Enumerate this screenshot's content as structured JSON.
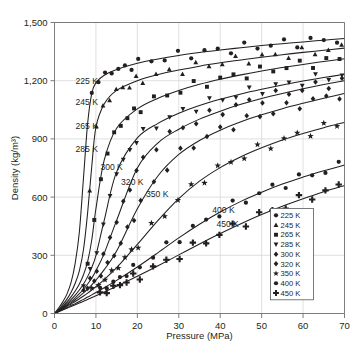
{
  "chart_data": {
    "type": "line",
    "title": "",
    "xlabel": "Pressure (MPa)",
    "ylabel": "Density (kg/m³)",
    "xlim": [
      0,
      70
    ],
    "ylim": [
      0,
      1500
    ],
    "xticks": [
      0,
      10,
      20,
      30,
      40,
      50,
      60,
      70
    ],
    "xtick_labels": [
      "0",
      "10",
      "20",
      "30",
      "40",
      "50",
      "60",
      "70"
    ],
    "yticks": [
      0,
      300,
      600,
      900,
      1200,
      1500
    ],
    "ytick_labels": [
      "0",
      "300",
      "600",
      "900",
      "1,200",
      "1,500"
    ],
    "grid": true,
    "legend_position": "inside-lower-right",
    "marker_color": "#231f20",
    "line_color": "#231f20",
    "grid_color": "#d8d8d8",
    "axis_color": "#6d6e71",
    "series": [
      {
        "name": "225 K",
        "label": "225 K",
        "marker": "circle",
        "inline_label": {
          "text": "225 K",
          "x": 10.5,
          "y": 1185
        },
        "line": {
          "x": [
            0,
            1,
            2,
            3,
            4,
            5,
            6,
            7,
            8,
            9,
            10,
            12,
            15,
            20,
            25,
            30,
            35,
            40,
            45,
            50,
            55,
            60,
            65,
            70
          ],
          "y": [
            0,
            28,
            60,
            100,
            160,
            260,
            420,
            700,
            980,
            1135,
            1190,
            1228,
            1258,
            1290,
            1312,
            1330,
            1345,
            1358,
            1370,
            1381,
            1391,
            1400,
            1409,
            1417
          ]
        },
        "points": {
          "x": [],
          "y": []
        }
      },
      {
        "name": "245 K",
        "label": "245 K",
        "marker": "triangle-up",
        "inline_label": {
          "text": "245 K",
          "x": 10.5,
          "y": 1075
        },
        "line": {
          "x": [
            0,
            1,
            2,
            3,
            4,
            5,
            6,
            7,
            8,
            9,
            10,
            12,
            15,
            20,
            25,
            30,
            35,
            40,
            45,
            50,
            55,
            60,
            65,
            70
          ],
          "y": [
            0,
            22,
            46,
            74,
            110,
            156,
            220,
            330,
            520,
            760,
            960,
            1080,
            1150,
            1200,
            1232,
            1255,
            1275,
            1292,
            1307,
            1321,
            1334,
            1346,
            1357,
            1368
          ]
        },
        "points": {
          "x": [],
          "y": []
        }
      },
      {
        "name": "265 K",
        "label": "265 K",
        "marker": "square",
        "inline_label": {
          "text": "265 K",
          "x": 10.5,
          "y": 952
        },
        "line": {
          "x": [
            0,
            1,
            2,
            3,
            4,
            5,
            6,
            7,
            8,
            9,
            10,
            12,
            15,
            20,
            25,
            30,
            35,
            40,
            45,
            50,
            55,
            60,
            65,
            70
          ],
          "y": [
            0,
            18,
            38,
            60,
            86,
            116,
            152,
            200,
            268,
            380,
            540,
            790,
            955,
            1055,
            1110,
            1150,
            1182,
            1208,
            1230,
            1250,
            1268,
            1284,
            1299,
            1313
          ]
        },
        "points": {
          "x": [],
          "y": []
        }
      },
      {
        "name": "285 K",
        "label": "285 K",
        "marker": "triangle-down",
        "inline_label": {
          "text": "285 K",
          "x": 10.5,
          "y": 835
        },
        "line": {
          "x": [
            0,
            1,
            2,
            3,
            4,
            5,
            6,
            7,
            8,
            9,
            10,
            12,
            15,
            20,
            25,
            30,
            35,
            40,
            45,
            50,
            55,
            60,
            65,
            70
          ],
          "y": [
            0,
            16,
            33,
            52,
            72,
            95,
            121,
            152,
            190,
            238,
            300,
            480,
            730,
            905,
            980,
            1032,
            1072,
            1104,
            1132,
            1156,
            1178,
            1198,
            1216,
            1233
          ]
        },
        "points": {
          "x": [],
          "y": []
        }
      },
      {
        "name": "300 K",
        "label": "300 K",
        "marker": "diamond",
        "inline_label": {
          "text": "300 K",
          "x": 16.5,
          "y": 740
        },
        "line": {
          "x": [
            0,
            1,
            2,
            3,
            4,
            5,
            6,
            7,
            8,
            9,
            10,
            12,
            15,
            20,
            25,
            30,
            35,
            40,
            45,
            50,
            55,
            60,
            65,
            70
          ],
          "y": [
            0,
            14,
            29,
            45,
            62,
            81,
            102,
            125,
            152,
            183,
            220,
            310,
            480,
            750,
            880,
            950,
            1002,
            1043,
            1078,
            1108,
            1134,
            1158,
            1180,
            1200
          ]
        },
        "points": {
          "x": [],
          "y": []
        }
      },
      {
        "name": "320 K",
        "label": "320 K",
        "marker": "diamond",
        "inline_label": {
          "text": "320 K",
          "x": 21.5,
          "y": 660
        },
        "line": {
          "x": [
            0,
            1,
            2,
            3,
            4,
            5,
            6,
            7,
            8,
            9,
            10,
            12,
            15,
            20,
            25,
            30,
            35,
            40,
            45,
            50,
            55,
            60,
            65,
            70
          ],
          "y": [
            0,
            13,
            26,
            40,
            55,
            71,
            88,
            106,
            126,
            148,
            172,
            226,
            322,
            540,
            710,
            820,
            892,
            945,
            988,
            1024,
            1056,
            1084,
            1110,
            1134
          ]
        },
        "points": {
          "x": [],
          "y": []
        }
      },
      {
        "name": "350 K",
        "label": "350 K",
        "marker": "star",
        "inline_label": {
          "text": "350 K",
          "x": 27.5,
          "y": 600
        },
        "line": {
          "x": [
            0,
            1,
            2,
            3,
            4,
            5,
            6,
            7,
            8,
            9,
            10,
            12,
            15,
            20,
            25,
            30,
            35,
            40,
            45,
            50,
            55,
            60,
            65,
            70
          ],
          "y": [
            0,
            12,
            24,
            36,
            49,
            62,
            76,
            90,
            105,
            121,
            138,
            175,
            236,
            356,
            480,
            592,
            682,
            752,
            808,
            854,
            894,
            928,
            958,
            985
          ]
        },
        "points": {
          "x": [],
          "y": []
        }
      },
      {
        "name": "400 K",
        "label": "400 K",
        "marker": "circle",
        "inline_label": {
          "text": "400 K",
          "x": 43.5,
          "y": 520
        },
        "line": {
          "x": [
            0,
            1,
            2,
            3,
            4,
            5,
            6,
            7,
            8,
            9,
            10,
            12,
            15,
            20,
            25,
            30,
            35,
            40,
            45,
            50,
            55,
            60,
            65,
            70
          ],
          "y": [
            0,
            10,
            20,
            30,
            41,
            51,
            62,
            73,
            85,
            96,
            108,
            133,
            171,
            240,
            314,
            390,
            460,
            523,
            578,
            625,
            667,
            703,
            736,
            765
          ]
        },
        "points": {
          "x": [],
          "y": []
        }
      },
      {
        "name": "450 K",
        "label": "450 K",
        "marker": "plus",
        "inline_label": {
          "text": "450 K",
          "x": 44.5,
          "y": 445
        },
        "line": {
          "x": [
            0,
            1,
            2,
            3,
            4,
            5,
            6,
            7,
            8,
            9,
            10,
            12,
            15,
            20,
            25,
            30,
            35,
            40,
            45,
            50,
            55,
            60,
            65,
            70
          ],
          "y": [
            0,
            9,
            18,
            27,
            36,
            45,
            54,
            63,
            72,
            82,
            91,
            111,
            141,
            192,
            246,
            302,
            358,
            412,
            463,
            510,
            553,
            592,
            628,
            660
          ]
        },
        "points": {
          "x": [],
          "y": []
        }
      }
    ]
  },
  "axes": {
    "x_title": "Pressure (MPa)",
    "y_title": "Density (kg/m³)"
  },
  "legend": {
    "entries": [
      {
        "label": "225 K",
        "marker": "circle"
      },
      {
        "label": "245 K",
        "marker": "triangle-up"
      },
      {
        "label": "265 K",
        "marker": "square"
      },
      {
        "label": "285 K",
        "marker": "triangle-down"
      },
      {
        "label": "300 K",
        "marker": "diamond"
      },
      {
        "label": "320 K",
        "marker": "diamond"
      },
      {
        "label": "350 K",
        "marker": "star"
      },
      {
        "label": "400 K",
        "marker": "circle"
      },
      {
        "label": "450 K",
        "marker": "plus"
      }
    ]
  }
}
